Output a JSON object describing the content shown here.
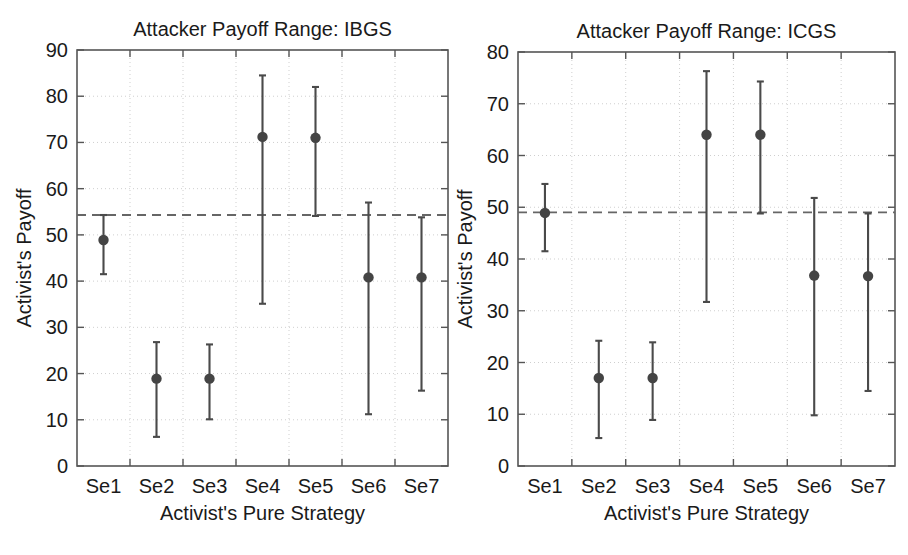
{
  "figure": {
    "background_color": "#ffffff",
    "text_color": "#1a1a1a",
    "grid_color": "#cfcfcf",
    "axis_color": "#555555",
    "series_color": "#4a4a4a",
    "marker_color": "#444444",
    "reference_line_color": "#666666"
  },
  "panels": [
    {
      "id": "ibgs",
      "title": "Attacker Payoff Range: IBGS",
      "xlabel": "Activist's Pure Strategy",
      "ylabel": "Activist's Payoff"
    },
    {
      "id": "icgs",
      "title": "Attacker Payoff Range: ICGS",
      "xlabel": "Activist's Pure Strategy",
      "ylabel": "Activist's Payoff"
    }
  ],
  "chart_data": [
    {
      "type": "scatter",
      "title": "Attacker Payoff Range: IBGS",
      "xlabel": "Activist's Pure Strategy",
      "ylabel": "Activist's Payoff",
      "categories": [
        "Se1",
        "Se2",
        "Se3",
        "Se4",
        "Se5",
        "Se6",
        "Se7"
      ],
      "xtick_labels": [
        "Se1",
        "Se2",
        "Se3",
        "Se4",
        "Se5",
        "Se6",
        "Se7"
      ],
      "ytick_labels": [
        "0",
        "10",
        "20",
        "30",
        "40",
        "50",
        "60",
        "70",
        "80",
        "90"
      ],
      "yticks": [
        0,
        10,
        20,
        30,
        40,
        50,
        60,
        70,
        80,
        90
      ],
      "ylim": [
        0,
        90
      ],
      "grid": true,
      "legend": "none",
      "series": [
        {
          "name": "Attacker payoff range",
          "values": [
            48.9,
            18.9,
            18.9,
            71.2,
            71.0,
            40.8,
            40.8
          ],
          "upper": [
            54.3,
            26.8,
            26.3,
            84.5,
            82.0,
            57.0,
            53.8
          ],
          "lower": [
            41.5,
            6.3,
            10.1,
            35.1,
            54.1,
            11.2,
            16.3
          ]
        }
      ],
      "reference_line": {
        "value": 54.3,
        "style": "dashed",
        "label": ""
      }
    },
    {
      "type": "scatter",
      "title": "Attacker Payoff Range: ICGS",
      "xlabel": "Activist's Pure Strategy",
      "ylabel": "Activist's Payoff",
      "categories": [
        "Se1",
        "Se2",
        "Se3",
        "Se4",
        "Se5",
        "Se6",
        "Se7"
      ],
      "xtick_labels": [
        "Se1",
        "Se2",
        "Se3",
        "Se4",
        "Se5",
        "Se6",
        "Se7"
      ],
      "ytick_labels": [
        "0",
        "10",
        "20",
        "30",
        "40",
        "50",
        "60",
        "70",
        "80"
      ],
      "yticks": [
        0,
        10,
        20,
        30,
        40,
        50,
        60,
        70,
        80
      ],
      "ylim": [
        0,
        80
      ],
      "grid": true,
      "legend": "none",
      "series": [
        {
          "name": "Attacker payoff range",
          "values": [
            48.9,
            17.0,
            17.0,
            64.0,
            64.0,
            36.8,
            36.7
          ],
          "upper": [
            54.5,
            24.2,
            23.9,
            76.3,
            74.3,
            51.8,
            48.8
          ],
          "lower": [
            41.5,
            5.4,
            8.9,
            31.7,
            48.8,
            9.8,
            14.5
          ]
        }
      ],
      "reference_line": {
        "value": 49.0,
        "style": "dashed",
        "label": ""
      }
    }
  ]
}
